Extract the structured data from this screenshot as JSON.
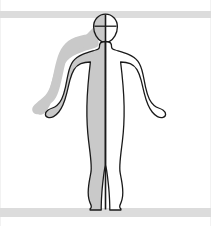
{
  "figure": {
    "name": "human-body-anterior-view",
    "view": "anterior",
    "pose": "standing, arms slightly abducted",
    "caption": ""
  },
  "colors": {
    "background": "#ffffff",
    "band": "#dcdcdc",
    "frame_border": "#f2f2f2",
    "outline": "#1a1a1a",
    "shaded_half_fill": "#c9c9c9",
    "unshaded_half_fill": "#ffffff",
    "midline": "#1a1a1a",
    "head_cross": "#1a1a1a"
  },
  "regions": {
    "head": "head-region",
    "neck": "neck-region",
    "torso": "torso-region",
    "left_arm": "left-arm-region",
    "right_arm": "right-arm-region",
    "left_hand": "left-hand-region",
    "right_hand": "right-hand-region",
    "left_leg": "left-leg-region",
    "right_leg": "right-leg-region",
    "left_foot": "left-foot-region",
    "right_foot": "right-foot-region"
  },
  "annotations": {
    "median_plane_line": "vertical-midline",
    "head_transverse_line": "head-cross-horizontal",
    "shaded_side": "left",
    "unshaded_side": "right"
  },
  "bands": {
    "top_label": "",
    "bottom_label": ""
  },
  "labels": []
}
